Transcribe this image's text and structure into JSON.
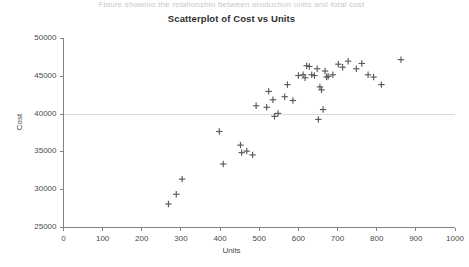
{
  "top_clip_text": "Figure showing the relationship between production units and total cost",
  "chart": {
    "title": "Scatterplot of Cost vs Units",
    "x_axis_title": "Units",
    "y_axis_title": "Cost"
  },
  "colors": {
    "marker": "#595959",
    "axis": "#808080",
    "gridline": "#d9d9d9",
    "title_text": "#2f2f2f",
    "label_text": "#4a4a4a",
    "background": "#ffffff"
  },
  "chart_data": {
    "type": "scatter",
    "title": "Scatterplot of Cost vs Units",
    "xlabel": "Units",
    "ylabel": "Cost",
    "xlim": [
      0,
      1000
    ],
    "ylim": [
      25000,
      50000
    ],
    "xticks": [
      0,
      100,
      200,
      300,
      400,
      500,
      600,
      700,
      800,
      900,
      1000
    ],
    "yticks": [
      25000,
      30000,
      35000,
      40000,
      45000,
      50000
    ],
    "grid": "horizontal-single-at-40000",
    "gridlines": [
      40000
    ],
    "legend": null,
    "marker": "plus",
    "series": [
      {
        "name": "Cost vs Units",
        "points": [
          [
            268,
            28100
          ],
          [
            288,
            29400
          ],
          [
            303,
            31400
          ],
          [
            398,
            37700
          ],
          [
            408,
            33400
          ],
          [
            452,
            35900
          ],
          [
            455,
            34900
          ],
          [
            468,
            35100
          ],
          [
            483,
            34600
          ],
          [
            492,
            41100
          ],
          [
            519,
            40900
          ],
          [
            524,
            43000
          ],
          [
            535,
            41900
          ],
          [
            539,
            39700
          ],
          [
            548,
            40100
          ],
          [
            565,
            42300
          ],
          [
            572,
            43900
          ],
          [
            586,
            41800
          ],
          [
            600,
            45100
          ],
          [
            612,
            45200
          ],
          [
            617,
            44800
          ],
          [
            621,
            46400
          ],
          [
            628,
            46300
          ],
          [
            634,
            45200
          ],
          [
            641,
            45100
          ],
          [
            648,
            46000
          ],
          [
            651,
            39300
          ],
          [
            655,
            43600
          ],
          [
            659,
            43200
          ],
          [
            663,
            40600
          ],
          [
            668,
            45700
          ],
          [
            672,
            44900
          ],
          [
            676,
            45000
          ],
          [
            688,
            45200
          ],
          [
            702,
            46600
          ],
          [
            713,
            46200
          ],
          [
            727,
            47000
          ],
          [
            748,
            46000
          ],
          [
            762,
            46700
          ],
          [
            778,
            45200
          ],
          [
            792,
            44900
          ],
          [
            812,
            43900
          ],
          [
            862,
            47200
          ]
        ]
      }
    ]
  }
}
